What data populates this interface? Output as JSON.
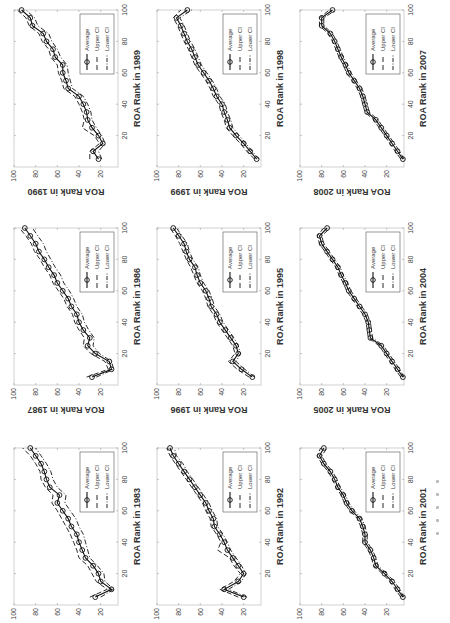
{
  "figure": {
    "orientation": "rotated-90-ccw",
    "legend": {
      "average_label": "Average",
      "upper_label": "Upper CI",
      "lower_label": "Lower CI"
    }
  },
  "chart_data": [
    {
      "type": "line",
      "panel": "row1-col1",
      "xlabel": "ROA Rank in 1983",
      "ylabel": "",
      "xlim": [
        0,
        100
      ],
      "ylim": [
        4,
        100
      ],
      "xticks": [
        20,
        40,
        60,
        80,
        100
      ],
      "yticks": [
        20,
        40,
        60,
        80,
        100
      ],
      "grid": false,
      "legend_position": "lower right",
      "x": [
        5,
        10,
        15,
        20,
        25,
        30,
        35,
        40,
        45,
        50,
        55,
        60,
        65,
        70,
        75,
        80,
        85,
        90,
        95,
        100
      ],
      "series": [
        {
          "name": "Average",
          "values": [
            25,
            10,
            20,
            22,
            27,
            34,
            37,
            40,
            42,
            47,
            50,
            55,
            60,
            58,
            67,
            70,
            72,
            75,
            80,
            85
          ]
        },
        {
          "name": "Upper CI",
          "values": [
            30,
            14,
            24,
            28,
            32,
            40,
            42,
            45,
            48,
            52,
            56,
            60,
            65,
            64,
            71,
            75,
            76,
            80,
            85,
            92
          ]
        },
        {
          "name": "Lower CI",
          "values": [
            20,
            8,
            16,
            17,
            23,
            30,
            32,
            34,
            36,
            40,
            43,
            48,
            53,
            52,
            60,
            64,
            66,
            70,
            75,
            80
          ]
        }
      ]
    },
    {
      "type": "line",
      "panel": "row1-col2",
      "xlabel": "ROA Rank in 1986",
      "ylabel": "ROA Rank in 1987",
      "xlim": [
        0,
        100
      ],
      "ylim": [
        4,
        100
      ],
      "xticks": [
        20,
        40,
        60,
        80,
        100
      ],
      "yticks": [
        20,
        40,
        60,
        80,
        100
      ],
      "grid": false,
      "legend_position": "lower right",
      "x": [
        5,
        10,
        15,
        20,
        25,
        30,
        35,
        40,
        45,
        50,
        55,
        60,
        65,
        70,
        75,
        80,
        85,
        90,
        95,
        100
      ],
      "series": [
        {
          "name": "Average",
          "values": [
            28,
            10,
            12,
            25,
            32,
            30,
            36,
            40,
            42,
            47,
            50,
            55,
            60,
            63,
            68,
            72,
            77,
            80,
            85,
            90
          ]
        },
        {
          "name": "Upper CI",
          "values": [
            33,
            13,
            16,
            29,
            36,
            35,
            40,
            44,
            46,
            51,
            54,
            59,
            64,
            67,
            72,
            76,
            81,
            84,
            89,
            95
          ]
        },
        {
          "name": "Lower CI",
          "values": [
            24,
            8,
            10,
            21,
            27,
            26,
            31,
            35,
            37,
            42,
            45,
            49,
            54,
            57,
            62,
            66,
            70,
            73,
            78,
            83
          ]
        }
      ]
    },
    {
      "type": "line",
      "panel": "row1-col3",
      "xlabel": "ROA Rank in 1989",
      "ylabel": "ROA Rank in 1990",
      "xlim": [
        0,
        100
      ],
      "ylim": [
        4,
        100
      ],
      "xticks": [
        20,
        40,
        60,
        80,
        100
      ],
      "yticks": [
        20,
        40,
        60,
        80,
        100
      ],
      "grid": false,
      "legend_position": "lower right",
      "x": [
        5,
        10,
        15,
        20,
        25,
        30,
        35,
        40,
        45,
        50,
        55,
        60,
        65,
        70,
        75,
        80,
        85,
        90,
        95,
        100
      ],
      "series": [
        {
          "name": "Average",
          "values": [
            22,
            27,
            18,
            22,
            28,
            32,
            33,
            36,
            40,
            50,
            52,
            55,
            55,
            62,
            64,
            70,
            73,
            83,
            85,
            93
          ]
        },
        {
          "name": "Upper CI",
          "values": [
            30,
            30,
            21,
            26,
            37,
            35,
            37,
            40,
            44,
            54,
            56,
            59,
            60,
            66,
            68,
            74,
            77,
            86,
            89,
            97
          ]
        },
        {
          "name": "Lower CI",
          "values": [
            19,
            22,
            16,
            19,
            24,
            28,
            29,
            32,
            36,
            46,
            48,
            50,
            51,
            57,
            60,
            65,
            68,
            78,
            81,
            89
          ]
        }
      ]
    },
    {
      "type": "line",
      "panel": "row2-col1",
      "xlabel": "ROA Rank in 1992",
      "ylabel": "",
      "xlim": [
        0,
        100
      ],
      "ylim": [
        4,
        100
      ],
      "xticks": [
        20,
        40,
        60,
        80,
        100
      ],
      "yticks": [
        20,
        40,
        60,
        80,
        100
      ],
      "grid": false,
      "legend_position": "lower right",
      "x": [
        5,
        10,
        15,
        20,
        25,
        30,
        35,
        40,
        45,
        50,
        55,
        60,
        65,
        70,
        75,
        80,
        85,
        90,
        95,
        100
      ],
      "series": [
        {
          "name": "Average",
          "values": [
            20,
            38,
            25,
            20,
            25,
            30,
            35,
            38,
            42,
            47,
            48,
            52,
            55,
            60,
            65,
            70,
            75,
            80,
            85,
            88
          ]
        },
        {
          "name": "Upper CI",
          "values": [
            25,
            42,
            29,
            23,
            29,
            33,
            44,
            41,
            45,
            50,
            51,
            55,
            58,
            63,
            68,
            73,
            78,
            83,
            88,
            91
          ]
        },
        {
          "name": "Lower CI",
          "values": [
            17,
            34,
            22,
            18,
            22,
            27,
            32,
            35,
            39,
            44,
            45,
            49,
            52,
            57,
            62,
            67,
            72,
            76,
            82,
            84
          ]
        }
      ]
    },
    {
      "type": "line",
      "panel": "row2-col2",
      "xlabel": "ROA Rank in 1995",
      "ylabel": "ROA Rank in 1996",
      "xlim": [
        0,
        100
      ],
      "ylim": [
        4,
        100
      ],
      "xticks": [
        20,
        40,
        60,
        80,
        100
      ],
      "yticks": [
        20,
        40,
        60,
        80,
        100
      ],
      "grid": false,
      "legend_position": "lower right",
      "x": [
        5,
        10,
        15,
        20,
        25,
        30,
        35,
        40,
        45,
        50,
        55,
        60,
        65,
        70,
        75,
        80,
        85,
        90,
        95,
        100
      ],
      "series": [
        {
          "name": "Average",
          "values": [
            12,
            22,
            30,
            25,
            27,
            32,
            37,
            42,
            45,
            50,
            52,
            55,
            60,
            63,
            65,
            70,
            73,
            75,
            80,
            85
          ]
        },
        {
          "name": "Upper CI",
          "values": [
            15,
            26,
            34,
            28,
            30,
            35,
            40,
            45,
            48,
            53,
            55,
            58,
            63,
            66,
            69,
            73,
            76,
            79,
            83,
            88
          ]
        },
        {
          "name": "Lower CI",
          "values": [
            10,
            19,
            27,
            23,
            25,
            29,
            34,
            39,
            42,
            47,
            49,
            52,
            57,
            60,
            62,
            67,
            70,
            72,
            77,
            82
          ]
        }
      ]
    },
    {
      "type": "line",
      "panel": "row2-col3",
      "xlabel": "ROA Rank in 1998",
      "ylabel": "ROA Rank in 1999",
      "xlim": [
        0,
        100
      ],
      "ylim": [
        4,
        100
      ],
      "xticks": [
        20,
        40,
        60,
        80,
        100
      ],
      "yticks": [
        20,
        40,
        60,
        80,
        100
      ],
      "grid": false,
      "legend_position": "lower right",
      "x": [
        5,
        10,
        15,
        20,
        25,
        30,
        35,
        40,
        45,
        50,
        55,
        60,
        65,
        70,
        75,
        80,
        85,
        90,
        95,
        100
      ],
      "series": [
        {
          "name": "Average",
          "values": [
            8,
            14,
            20,
            27,
            33,
            35,
            38,
            40,
            45,
            48,
            52,
            57,
            62,
            65,
            68,
            72,
            75,
            78,
            82,
            72
          ]
        },
        {
          "name": "Upper CI",
          "values": [
            10,
            17,
            23,
            30,
            36,
            38,
            41,
            43,
            48,
            51,
            55,
            60,
            65,
            68,
            71,
            75,
            78,
            81,
            85,
            78
          ]
        },
        {
          "name": "Lower CI",
          "values": [
            6,
            12,
            18,
            24,
            30,
            32,
            35,
            37,
            42,
            45,
            49,
            54,
            59,
            62,
            65,
            69,
            72,
            75,
            79,
            68
          ]
        }
      ]
    },
    {
      "type": "line",
      "panel": "row3-col1",
      "xlabel": "ROA Rank in 2001",
      "ylabel": "",
      "xlim": [
        0,
        100
      ],
      "ylim": [
        4,
        100
      ],
      "xticks": [
        20,
        40,
        60,
        80,
        100
      ],
      "yticks": [
        20,
        40,
        60,
        80,
        100
      ],
      "grid": false,
      "legend_position": "lower right",
      "x": [
        5,
        10,
        15,
        20,
        25,
        30,
        35,
        40,
        45,
        50,
        55,
        60,
        65,
        70,
        75,
        80,
        85,
        90,
        95,
        100
      ],
      "series": [
        {
          "name": "Average",
          "values": [
            5,
            10,
            15,
            22,
            30,
            32,
            35,
            40,
            40,
            42,
            45,
            52,
            57,
            60,
            65,
            68,
            72,
            78,
            82,
            78
          ]
        },
        {
          "name": "Upper CI",
          "values": [
            7,
            12,
            17,
            24,
            32,
            34,
            37,
            42,
            42,
            44,
            47,
            54,
            59,
            62,
            67,
            70,
            74,
            80,
            84,
            81
          ]
        },
        {
          "name": "Lower CI",
          "values": [
            4,
            8,
            13,
            20,
            28,
            30,
            33,
            38,
            38,
            40,
            43,
            50,
            55,
            58,
            63,
            66,
            70,
            76,
            80,
            75
          ]
        }
      ]
    },
    {
      "type": "line",
      "panel": "row3-col2",
      "xlabel": "ROA Rank in 2004",
      "ylabel": "ROA Rank in 2005",
      "xlim": [
        0,
        100
      ],
      "ylim": [
        4,
        100
      ],
      "xticks": [
        20,
        40,
        60,
        80,
        100
      ],
      "yticks": [
        20,
        40,
        60,
        80,
        100
      ],
      "grid": false,
      "legend_position": "lower right",
      "x": [
        5,
        10,
        15,
        20,
        25,
        30,
        35,
        40,
        45,
        50,
        55,
        60,
        65,
        70,
        75,
        80,
        85,
        90,
        95,
        100
      ],
      "series": [
        {
          "name": "Average",
          "values": [
            5,
            10,
            15,
            20,
            25,
            35,
            36,
            37,
            40,
            45,
            50,
            55,
            58,
            62,
            65,
            70,
            75,
            80,
            82,
            75
          ]
        },
        {
          "name": "Upper CI",
          "values": [
            7,
            12,
            17,
            22,
            27,
            37,
            38,
            39,
            42,
            47,
            52,
            57,
            60,
            64,
            67,
            72,
            77,
            82,
            84,
            78
          ]
        },
        {
          "name": "Lower CI",
          "values": [
            4,
            8,
            13,
            18,
            23,
            33,
            34,
            35,
            38,
            43,
            48,
            53,
            56,
            60,
            63,
            68,
            73,
            78,
            80,
            72
          ]
        }
      ]
    },
    {
      "type": "line",
      "panel": "row3-col3",
      "xlabel": "ROA Rank in 2007",
      "ylabel": "ROA Rank in 2008",
      "xlim": [
        0,
        100
      ],
      "ylim": [
        4,
        100
      ],
      "xticks": [
        20,
        40,
        60,
        80,
        100
      ],
      "yticks": [
        20,
        40,
        60,
        80,
        100
      ],
      "grid": false,
      "legend_position": "lower right",
      "x": [
        5,
        10,
        15,
        20,
        25,
        30,
        35,
        40,
        45,
        50,
        55,
        60,
        65,
        70,
        75,
        80,
        85,
        90,
        95,
        100
      ],
      "series": [
        {
          "name": "Average",
          "values": [
            5,
            10,
            15,
            20,
            25,
            30,
            38,
            40,
            42,
            45,
            50,
            55,
            58,
            62,
            65,
            68,
            72,
            80,
            80,
            70
          ]
        },
        {
          "name": "Upper CI",
          "values": [
            7,
            12,
            17,
            22,
            27,
            32,
            40,
            42,
            44,
            47,
            52,
            57,
            60,
            64,
            67,
            70,
            74,
            82,
            82,
            73
          ]
        },
        {
          "name": "Lower CI",
          "values": [
            4,
            8,
            13,
            18,
            23,
            28,
            36,
            38,
            40,
            43,
            48,
            53,
            56,
            60,
            63,
            66,
            70,
            78,
            78,
            67
          ]
        }
      ]
    }
  ]
}
